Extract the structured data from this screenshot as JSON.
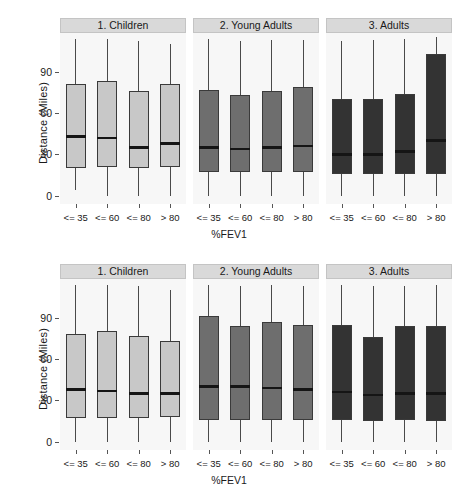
{
  "chart_data": {
    "type": "boxplot",
    "title": "",
    "xlabel": "%FEV1",
    "ylabel": "Distance (Miles)",
    "ylim": [
      -6,
      118
    ],
    "yticks": [
      0,
      30,
      60,
      90
    ],
    "ytick_labels": [
      "0",
      "30",
      "60",
      "90"
    ],
    "categories": [
      "<= 35",
      "<= 60",
      "<= 80",
      "> 80"
    ],
    "facet_columns": [
      "1. Children",
      "2. Young Adults",
      "3. Adults"
    ],
    "facet_colors": [
      "#c8c8c8",
      "#6e6e6e",
      "#333333"
    ],
    "grid": false,
    "legend": "none",
    "panels": [
      {
        "row": 0,
        "facets": [
          {
            "label": "1. Children",
            "fill": "#c8c8c8",
            "boxes": [
              {
                "category": "<= 35",
                "lower_whisker": 4,
                "q1": 20,
                "median": 43,
                "q3": 81,
                "upper_whisker": 114
              },
              {
                "category": "<= 60",
                "lower_whisker": 0,
                "q1": 21,
                "median": 42,
                "q3": 83,
                "upper_whisker": 114
              },
              {
                "category": "<= 80",
                "lower_whisker": 0,
                "q1": 20,
                "median": 35,
                "q3": 76,
                "upper_whisker": 112
              },
              {
                "category": "> 80",
                "lower_whisker": 0,
                "q1": 21,
                "median": 38,
                "q3": 81,
                "upper_whisker": 110
              }
            ]
          },
          {
            "label": "2. Young Adults",
            "fill": "#6e6e6e",
            "boxes": [
              {
                "category": "<= 35",
                "lower_whisker": 0,
                "q1": 17,
                "median": 35,
                "q3": 77,
                "upper_whisker": 114
              },
              {
                "category": "<= 60",
                "lower_whisker": 0,
                "q1": 17,
                "median": 34,
                "q3": 73,
                "upper_whisker": 112
              },
              {
                "category": "<= 80",
                "lower_whisker": 0,
                "q1": 17,
                "median": 35,
                "q3": 76,
                "upper_whisker": 113
              },
              {
                "category": "> 80",
                "lower_whisker": 0,
                "q1": 17,
                "median": 36,
                "q3": 79,
                "upper_whisker": 113
              }
            ]
          },
          {
            "label": "3. Adults",
            "fill": "#333333",
            "boxes": [
              {
                "category": "<= 35",
                "lower_whisker": 0,
                "q1": 16,
                "median": 30,
                "q3": 70,
                "upper_whisker": 112
              },
              {
                "category": "<= 60",
                "lower_whisker": 0,
                "q1": 16,
                "median": 30,
                "q3": 70,
                "upper_whisker": 113
              },
              {
                "category": "<= 80",
                "lower_whisker": 0,
                "q1": 16,
                "median": 32,
                "q3": 74,
                "upper_whisker": 114
              },
              {
                "category": "> 80",
                "lower_whisker": 0,
                "q1": 16,
                "median": 40,
                "q3": 103,
                "upper_whisker": 115
              }
            ]
          }
        ]
      },
      {
        "row": 1,
        "facets": [
          {
            "label": "1. Children",
            "fill": "#c8c8c8",
            "boxes": [
              {
                "category": "<= 35",
                "lower_whisker": 0,
                "q1": 17,
                "median": 38,
                "q3": 78,
                "upper_whisker": 114
              },
              {
                "category": "<= 60",
                "lower_whisker": 0,
                "q1": 17,
                "median": 37,
                "q3": 80,
                "upper_whisker": 114
              },
              {
                "category": "<= 80",
                "lower_whisker": 0,
                "q1": 17,
                "median": 35,
                "q3": 77,
                "upper_whisker": 113
              },
              {
                "category": "> 80",
                "lower_whisker": 0,
                "q1": 18,
                "median": 35,
                "q3": 73,
                "upper_whisker": 110
              }
            ]
          },
          {
            "label": "2. Young Adults",
            "fill": "#6e6e6e",
            "boxes": [
              {
                "category": "<= 35",
                "lower_whisker": 0,
                "q1": 16,
                "median": 40,
                "q3": 91,
                "upper_whisker": 114
              },
              {
                "category": "<= 60",
                "lower_whisker": 0,
                "q1": 16,
                "median": 40,
                "q3": 84,
                "upper_whisker": 113
              },
              {
                "category": "<= 80",
                "lower_whisker": 0,
                "q1": 16,
                "median": 39,
                "q3": 87,
                "upper_whisker": 114
              },
              {
                "category": "> 80",
                "lower_whisker": 0,
                "q1": 16,
                "median": 38,
                "q3": 85,
                "upper_whisker": 113
              }
            ]
          },
          {
            "label": "3. Adults",
            "fill": "#333333",
            "boxes": [
              {
                "category": "<= 35",
                "lower_whisker": 0,
                "q1": 16,
                "median": 36,
                "q3": 85,
                "upper_whisker": 114
              },
              {
                "category": "<= 60",
                "lower_whisker": 0,
                "q1": 15,
                "median": 34,
                "q3": 76,
                "upper_whisker": 113
              },
              {
                "category": "<= 80",
                "lower_whisker": 0,
                "q1": 16,
                "median": 35,
                "q3": 84,
                "upper_whisker": 113
              },
              {
                "category": "> 80",
                "lower_whisker": 0,
                "q1": 15,
                "median": 35,
                "q3": 84,
                "upper_whisker": 114
              }
            ]
          }
        ]
      }
    ]
  },
  "axis": {
    "y_title": "Distance (Miles)",
    "x_title": "%FEV1"
  }
}
